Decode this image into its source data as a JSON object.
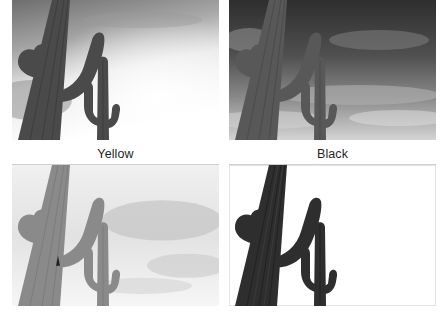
{
  "figure": {
    "panels": [
      {
        "id": "top-left",
        "caption": "",
        "tone": "light",
        "sky": {
          "top": "#6e6e6e",
          "mid": "#bdbdbd",
          "bottom": "#ffffff"
        },
        "cactus": "#4a4a4a",
        "rib": "#2e2e2e"
      },
      {
        "id": "top-right",
        "caption": "",
        "tone": "stormy",
        "sky": {
          "top": "#2e2e2e",
          "mid": "#5a5a5a",
          "bottom": "#d8d8d8"
        },
        "cactus": "#585858",
        "rib": "#3a3a3a"
      },
      {
        "id": "bottom-left",
        "caption": "Yellow",
        "tone": "washed",
        "sky": {
          "top": "#f2f2f2",
          "mid": "#cccccc",
          "bottom": "#f4f4f4"
        },
        "cactus": "#8a8a8a",
        "rib": "#6a6a6a"
      },
      {
        "id": "bottom-right",
        "caption": "Black",
        "tone": "white-sky",
        "sky": {
          "top": "#ffffff",
          "mid": "#ffffff",
          "bottom": "#ffffff"
        },
        "cactus": "#2e2e2e",
        "rib": "#151515"
      }
    ]
  }
}
